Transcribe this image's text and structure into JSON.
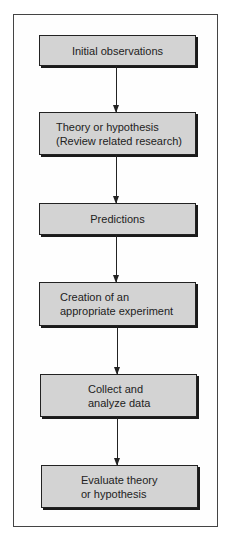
{
  "diagram": {
    "type": "flowchart",
    "direction": "top-to-bottom",
    "colors": {
      "box_fill": "#d3d3d3",
      "box_border": "#222222",
      "arrow": "#222222",
      "frame": "#444444"
    },
    "steps": [
      {
        "line1": "Initial observations",
        "line2": ""
      },
      {
        "line1": "Theory or hypothesis",
        "line2": "(Review related research)"
      },
      {
        "line1": "Predictions",
        "line2": ""
      },
      {
        "line1": "Creation of an",
        "line2": "appropriate experiment"
      },
      {
        "line1": "Collect and",
        "line2": "analyze data"
      },
      {
        "line1": "Evaluate theory",
        "line2": "or hypothesis"
      }
    ],
    "edges": [
      {
        "from": 0,
        "to": 1
      },
      {
        "from": 1,
        "to": 2
      },
      {
        "from": 2,
        "to": 3
      },
      {
        "from": 3,
        "to": 4
      },
      {
        "from": 4,
        "to": 5
      }
    ]
  }
}
